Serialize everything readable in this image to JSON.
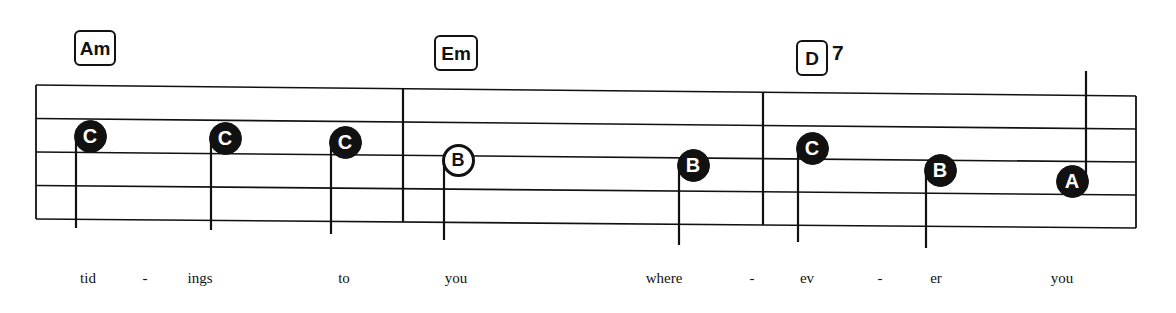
{
  "sheet": {
    "title": "music-staff-excerpt",
    "ink_color": "#111111",
    "paper_color": "#ffffff",
    "staff": {
      "line_count": 5,
      "left_x": 36,
      "right_x": 1136,
      "left_top_y": 85,
      "left_bottom_y": 219,
      "right_top_y": 96,
      "right_bottom_y": 228
    },
    "barlines": [
      {
        "name": "barline-1",
        "x": 403
      },
      {
        "name": "barline-2",
        "x": 763
      }
    ]
  },
  "chords": [
    {
      "name": "chord-am",
      "root": "Am",
      "extension": "",
      "x": 74,
      "y": 30,
      "w": 42,
      "h": 36
    },
    {
      "name": "chord-em",
      "root": "Em",
      "extension": "",
      "x": 434,
      "y": 35,
      "w": 44,
      "h": 36
    },
    {
      "name": "chord-d7",
      "root": "D",
      "extension": "7",
      "x": 796,
      "y": 40,
      "w": 32,
      "h": 36
    }
  ],
  "notes": [
    {
      "name": "note-c-1",
      "pitch": "C",
      "x": 90,
      "y": 136,
      "filled": true,
      "stem": "down",
      "stem_len": 92
    },
    {
      "name": "note-c-2",
      "pitch": "C",
      "x": 225,
      "y": 138,
      "filled": true,
      "stem": "down",
      "stem_len": 92
    },
    {
      "name": "note-c-3",
      "pitch": "C",
      "x": 345,
      "y": 142,
      "filled": true,
      "stem": "down",
      "stem_len": 92
    },
    {
      "name": "note-b-1",
      "pitch": "B",
      "x": 458,
      "y": 160,
      "filled": false,
      "stem": "down",
      "stem_len": 80
    },
    {
      "name": "note-b-2",
      "pitch": "B",
      "x": 693,
      "y": 165,
      "filled": true,
      "stem": "down",
      "stem_len": 80
    },
    {
      "name": "note-c-4",
      "pitch": "C",
      "x": 812,
      "y": 148,
      "filled": true,
      "stem": "down",
      "stem_len": 94
    },
    {
      "name": "note-b-3",
      "pitch": "B",
      "x": 940,
      "y": 170,
      "filled": true,
      "stem": "down",
      "stem_len": 78
    },
    {
      "name": "note-a-1",
      "pitch": "A",
      "x": 1072,
      "y": 181,
      "filled": true,
      "stem": "up",
      "stem_len": 110
    }
  ],
  "lyrics": [
    {
      "name": "lyric-tid",
      "text": "tid",
      "x": 88
    },
    {
      "name": "lyric-dash-1",
      "text": "-",
      "x": 145
    },
    {
      "name": "lyric-ings",
      "text": "ings",
      "x": 200
    },
    {
      "name": "lyric-to",
      "text": "to",
      "x": 344
    },
    {
      "name": "lyric-you-1",
      "text": "you",
      "x": 456
    },
    {
      "name": "lyric-where",
      "text": "where",
      "x": 664
    },
    {
      "name": "lyric-dash-2",
      "text": "-",
      "x": 752
    },
    {
      "name": "lyric-ev",
      "text": "ev",
      "x": 807
    },
    {
      "name": "lyric-dash-3",
      "text": "-",
      "x": 880
    },
    {
      "name": "lyric-er",
      "text": "er",
      "x": 936
    },
    {
      "name": "lyric-you-2",
      "text": "you",
      "x": 1062
    }
  ],
  "lyrics_baseline_y": 270
}
